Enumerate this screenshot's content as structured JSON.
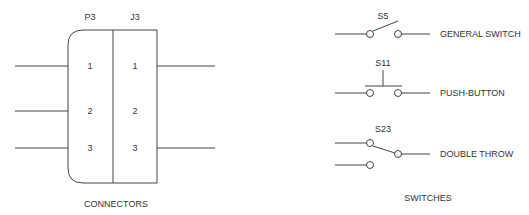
{
  "connectors": {
    "caption": "CONNECTORS",
    "plug": {
      "label": "P3",
      "pins": [
        "1",
        "2",
        "3"
      ]
    },
    "jack": {
      "label": "J3",
      "pins": [
        "1",
        "2",
        "3"
      ]
    }
  },
  "switches": {
    "caption": "SWITCHES",
    "items": [
      {
        "ref": "S5",
        "name": "GENERAL SWITCH"
      },
      {
        "ref": "S11",
        "name": "PUSH-BUTTON"
      },
      {
        "ref": "S23",
        "name": "DOUBLE THROW"
      }
    ]
  }
}
